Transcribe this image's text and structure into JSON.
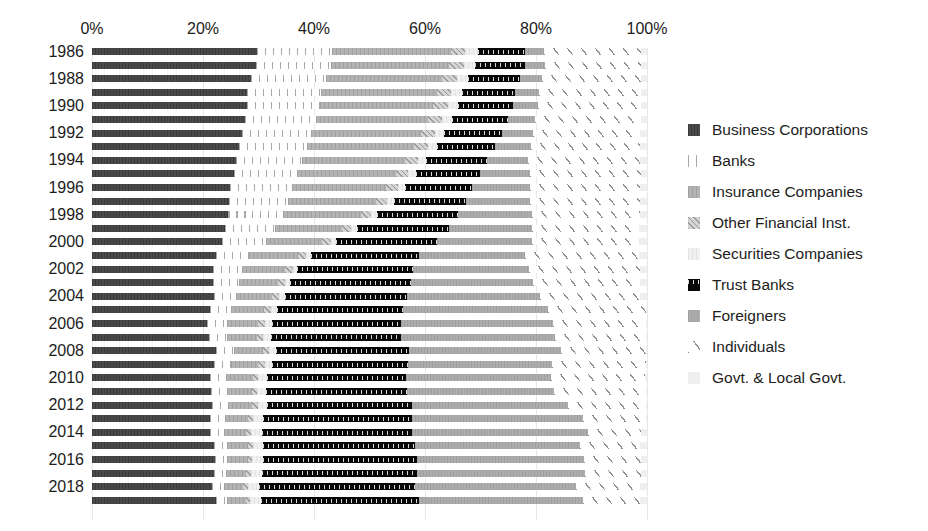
{
  "chart_data": {
    "type": "bar",
    "subtype": "horizontal-stacked-100pct",
    "title": "",
    "xlabel": "",
    "ylabel": "",
    "xlim": [
      0,
      100
    ],
    "xticks": [
      0,
      20,
      40,
      60,
      80,
      100
    ],
    "xtick_labels": [
      "0%",
      "20%",
      "40%",
      "60%",
      "80%",
      "100%"
    ],
    "grid": true,
    "legend_position": "right",
    "categories": [
      "1986",
      "1987",
      "1988",
      "1989",
      "1990",
      "1991",
      "1992",
      "1993",
      "1994",
      "1995",
      "1996",
      "1997",
      "1998",
      "1999",
      "2000",
      "2001",
      "2002",
      "2003",
      "2004",
      "2005",
      "2006",
      "2007",
      "2008",
      "2009",
      "2010",
      "2011",
      "2012",
      "2013",
      "2014",
      "2015",
      "2016",
      "2017",
      "2018",
      "2019"
    ],
    "visible_tick_labels": [
      "1986",
      "1988",
      "1990",
      "1992",
      "1994",
      "1996",
      "1998",
      "2000",
      "2002",
      "2004",
      "2006",
      "2008",
      "2010",
      "2012",
      "2014",
      "2016",
      "2018"
    ],
    "series": [
      {
        "name": "Business Corporations",
        "key": "business",
        "color": "#4a4a4a",
        "pattern": "solid-dark",
        "values": [
          29.8,
          29.5,
          28.7,
          28.0,
          28.0,
          27.5,
          27.0,
          26.5,
          26.0,
          25.5,
          24.9,
          24.6,
          24.5,
          24.0,
          23.5,
          22.3,
          21.8,
          21.8,
          21.9,
          21.3,
          20.8,
          21.1,
          22.4,
          21.9,
          21.2,
          21.6,
          21.7,
          21.3,
          21.3,
          21.9,
          22.1,
          22.0,
          21.7,
          22.3
        ]
      },
      {
        "name": "Banks",
        "key": "banks",
        "color": "#a8a8a8",
        "pattern": "vertical-lines",
        "values": [
          13.4,
          13.6,
          13.5,
          13.3,
          13.0,
          12.8,
          12.5,
          12.3,
          11.9,
          11.5,
          11.2,
          10.8,
          10.0,
          9.0,
          7.8,
          6.0,
          5.3,
          4.7,
          4.1,
          3.7,
          3.5,
          3.3,
          3.2,
          3.1,
          3.0,
          2.9,
          2.8,
          2.6,
          2.5,
          2.4,
          2.3,
          2.2,
          2.1,
          2.0
        ]
      },
      {
        "name": "Insurance Companies",
        "key": "insurance",
        "color": "#b3b3b3",
        "pattern": "gray-solid",
        "values": [
          21.4,
          21.2,
          20.9,
          20.8,
          20.5,
          20.3,
          19.8,
          19.3,
          18.5,
          17.8,
          16.9,
          15.8,
          14.0,
          12.0,
          10.2,
          8.8,
          7.7,
          7.0,
          6.4,
          6.0,
          5.7,
          5.4,
          5.2,
          5.0,
          4.8,
          4.6,
          4.4,
          4.2,
          4.0,
          3.8,
          3.7,
          3.6,
          3.5,
          3.4
        ]
      },
      {
        "name": "Other Financial Inst.",
        "key": "otherfin",
        "color": "#d4d4d4",
        "pattern": "diagonal-hatch-light",
        "values": [
          2.7,
          2.7,
          2.6,
          2.6,
          2.6,
          2.5,
          2.5,
          2.4,
          2.3,
          2.2,
          2.1,
          2.0,
          1.8,
          1.7,
          1.6,
          1.5,
          1.4,
          1.3,
          1.3,
          1.2,
          1.2,
          1.1,
          1.1,
          1.1,
          1.0,
          1.0,
          1.0,
          0.9,
          0.9,
          0.9,
          0.8,
          0.8,
          0.8,
          0.8
        ]
      },
      {
        "name": "Securities Companies",
        "key": "securities",
        "color": "#f0f0f0",
        "pattern": "very-light",
        "values": [
          2.2,
          2.1,
          2.0,
          2.0,
          1.9,
          1.8,
          1.7,
          1.6,
          1.5,
          1.4,
          1.3,
          1.2,
          1.1,
          1.0,
          0.9,
          0.8,
          0.8,
          0.9,
          1.1,
          1.2,
          1.2,
          1.3,
          1.3,
          1.4,
          1.5,
          1.6,
          1.7,
          1.8,
          1.9,
          1.9,
          2.0,
          2.0,
          2.0,
          2.0
        ]
      },
      {
        "name": "Trust Banks",
        "key": "trust",
        "color": "#080808",
        "pattern": "black-checkered",
        "values": [
          8.6,
          9.0,
          9.4,
          9.6,
          9.8,
          10.0,
          10.3,
          10.6,
          11.0,
          11.5,
          12.0,
          13.0,
          14.5,
          16.6,
          18.2,
          19.6,
          20.8,
          21.7,
          22.0,
          22.7,
          23.2,
          23.5,
          24.0,
          24.4,
          25.0,
          25.7,
          26.1,
          26.8,
          27.0,
          27.3,
          27.6,
          27.9,
          28.1,
          28.4
        ]
      },
      {
        "name": "Foreigners",
        "key": "foreigners",
        "color": "#adadad",
        "pattern": "gray-medium",
        "values": [
          3.4,
          3.6,
          4.0,
          4.2,
          4.5,
          5.0,
          5.7,
          6.4,
          7.4,
          9.0,
          10.5,
          11.6,
          13.4,
          15.0,
          17.0,
          19.0,
          21.0,
          22.0,
          24.0,
          26.0,
          27.5,
          27.8,
          27.4,
          26.0,
          26.3,
          26.6,
          28.0,
          30.8,
          31.7,
          29.8,
          30.1,
          30.3,
          29.1,
          29.6
        ]
      },
      {
        "name": "Individuals",
        "key": "individuals",
        "color": "#8f8f8f",
        "pattern": "diagonal-lines",
        "values": [
          17.4,
          17.2,
          17.8,
          18.4,
          18.6,
          19.0,
          19.3,
          19.7,
          20.2,
          20.0,
          19.9,
          19.8,
          19.4,
          19.2,
          19.4,
          20.6,
          20.0,
          19.4,
          18.0,
          17.7,
          16.7,
          16.3,
          15.2,
          16.9,
          16.9,
          16.8,
          14.1,
          11.4,
          9.6,
          10.8,
          10.3,
          10.1,
          11.5,
          10.3
        ]
      },
      {
        "name": "Govt. & Local Govt.",
        "key": "govt",
        "color": "#efefef",
        "pattern": "near-white",
        "values": [
          1.1,
          1.1,
          1.1,
          1.1,
          1.1,
          1.1,
          1.2,
          1.2,
          1.2,
          1.1,
          1.2,
          1.2,
          1.3,
          1.5,
          1.4,
          1.4,
          1.2,
          1.2,
          1.2,
          0.2,
          0.2,
          0.2,
          0.2,
          0.2,
          0.3,
          0.2,
          0.2,
          0.2,
          1.1,
          1.2,
          1.1,
          1.1,
          1.2,
          1.2
        ]
      }
    ]
  },
  "legend": {
    "items": [
      {
        "label": "Business Corporations",
        "key": "business"
      },
      {
        "label": "Banks",
        "key": "banks"
      },
      {
        "label": "Insurance Companies",
        "key": "insurance"
      },
      {
        "label": "Other Financial Inst.",
        "key": "otherfin"
      },
      {
        "label": "Securities Companies",
        "key": "securities"
      },
      {
        "label": "Trust Banks",
        "key": "trust"
      },
      {
        "label": "Foreigners",
        "key": "foreigners"
      },
      {
        "label": "Individuals",
        "key": "individuals"
      },
      {
        "label": "Govt. & Local Govt.",
        "key": "govt"
      }
    ]
  }
}
